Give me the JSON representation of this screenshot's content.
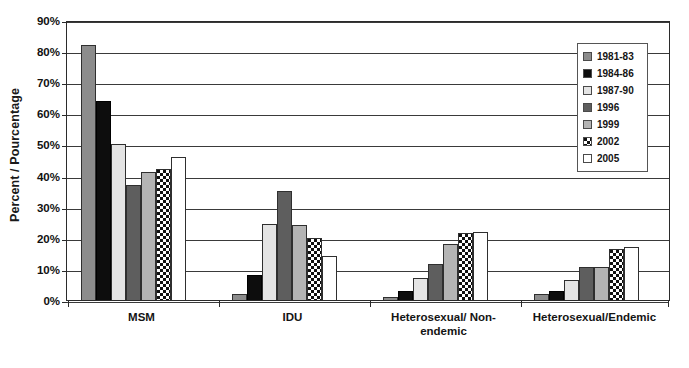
{
  "chart_data": {
    "type": "bar",
    "title": "",
    "xlabel": "",
    "ylabel": "Percent / Pourcentage",
    "ylim": [
      0,
      90
    ],
    "ytick_labels": [
      "0%",
      "10%",
      "20%",
      "30%",
      "40%",
      "50%",
      "60%",
      "70%",
      "80%",
      "90%"
    ],
    "ytick_values": [
      0,
      10,
      20,
      30,
      40,
      50,
      60,
      70,
      80,
      90
    ],
    "grid": true,
    "legend_position": "top-right",
    "categories": [
      "MSM",
      "IDU",
      "Heterosexual/ Non-endemic",
      "Heterosexual/Endemic"
    ],
    "category_lines": [
      [
        "MSM"
      ],
      [
        "IDU"
      ],
      [
        "Heterosexual/ Non-",
        "endemic"
      ],
      [
        "Heterosexual/Endemic"
      ]
    ],
    "series": [
      {
        "name": "1981-83",
        "color": "#8c8c8c",
        "swatch": "solid-medium-gray",
        "values": [
          82,
          2,
          1,
          2
        ]
      },
      {
        "name": "1984-86",
        "color": "#0d0d0d",
        "swatch": "solid-black",
        "values": [
          64,
          8,
          3,
          3
        ]
      },
      {
        "name": "1987-90",
        "color": "#e4e4e4",
        "swatch": "solid-very-light-gray",
        "values": [
          50,
          24.5,
          7,
          6.5
        ]
      },
      {
        "name": "1996",
        "color": "#5e5e5e",
        "swatch": "solid-dark-gray",
        "values": [
          37,
          35,
          11.5,
          10.5
        ]
      },
      {
        "name": "1999",
        "color": "#b4b4b4",
        "swatch": "solid-light-gray",
        "values": [
          41,
          24,
          18,
          10.5
        ]
      },
      {
        "name": "2002",
        "color": "#ffffff",
        "swatch": "checkered-dot-pattern",
        "values": [
          42,
          20,
          21.5,
          16.5
        ]
      },
      {
        "name": "2005",
        "color": "#ffffff",
        "swatch": "solid-white",
        "values": [
          46,
          14,
          22,
          17
        ]
      }
    ]
  },
  "legend": {
    "items": [
      {
        "label": "1981-83",
        "swatch_class": "sw-1981"
      },
      {
        "label": "1984-86",
        "swatch_class": "sw-1984"
      },
      {
        "label": "1987-90",
        "swatch_class": "sw-1987"
      },
      {
        "label": "1996",
        "swatch_class": "sw-1996"
      },
      {
        "label": "1999",
        "swatch_class": "sw-1999"
      },
      {
        "label": "2002",
        "swatch_class": "sw-2002"
      },
      {
        "label": "2005",
        "swatch_class": "sw-2005"
      }
    ]
  }
}
